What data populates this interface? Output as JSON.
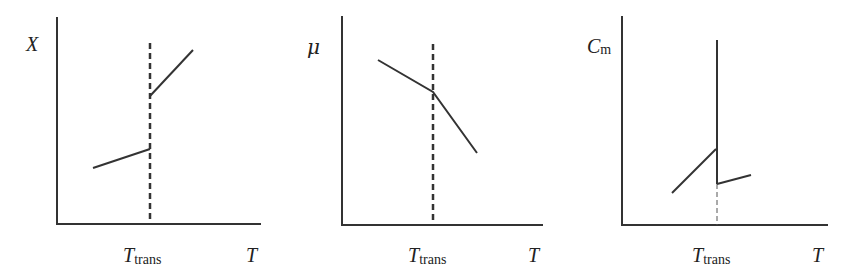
{
  "panels": [
    {
      "id": "X-vs-T",
      "y_label": "X",
      "x_label": "T",
      "transition_label_main": "T",
      "transition_label_sub": "trans",
      "description": "X jumps discontinuously upward at T_trans"
    },
    {
      "id": "mu-vs-T",
      "y_label": "μ",
      "x_label": "T",
      "transition_label_main": "T",
      "transition_label_sub": "trans",
      "description": "μ continuous with a kink (slope change) at T_trans"
    },
    {
      "id": "Cm-vs-T",
      "y_label_main": "C",
      "y_label_sub": "m",
      "x_label": "T",
      "transition_label_main": "T",
      "transition_label_sub": "trans",
      "description": "Cm diverges (infinite spike) at T_trans"
    }
  ],
  "colors": {
    "line": "#333333",
    "background": "#ffffff"
  }
}
